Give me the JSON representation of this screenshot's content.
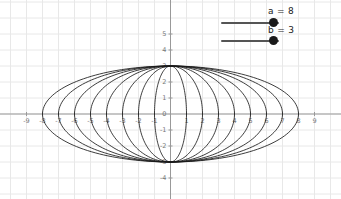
{
  "app": {
    "title": "Graphing Calculator"
  },
  "sliders": [
    {
      "name": "a",
      "label": "a = 8",
      "value": 8,
      "min": 1,
      "max": 9
    },
    {
      "name": "b",
      "label": "b = 3",
      "value": 3,
      "min": 1,
      "max": 5
    }
  ],
  "chart_data": {
    "type": "line",
    "title": "",
    "xlabel": "",
    "ylabel": "",
    "xlim": [
      -9.8,
      9.8
    ],
    "ylim": [
      -4.8,
      9.6
    ],
    "grid": true,
    "legend": false,
    "axis_color": "#999999",
    "grid_color": "#e8e8e8",
    "curve_color": "#1a1a1a",
    "x_ticks": [
      -9,
      -8,
      -7,
      -6,
      -5,
      -4,
      -3,
      -2,
      -1,
      0,
      1,
      2,
      3,
      4,
      5,
      6,
      7,
      8,
      9
    ],
    "x_tick_labels": [
      "-9",
      "-8",
      "-7",
      "-6",
      "-5",
      "-4",
      "-3",
      "-2",
      "-1",
      "",
      "1",
      "2",
      "3",
      "4",
      "5",
      "6",
      "7",
      "8",
      "9"
    ],
    "y_ticks": [
      -4,
      -3,
      -2,
      -1,
      0,
      1,
      2,
      3,
      4,
      5,
      9
    ],
    "y_tick_labels": [
      "-4",
      "-3",
      "-2",
      "-1",
      "0",
      "1",
      "2",
      "3",
      "4",
      "5",
      "9"
    ],
    "series": [
      {
        "name": "ellipse-k1",
        "semi_x": 1,
        "semi_y": 3
      },
      {
        "name": "ellipse-k2",
        "semi_x": 2,
        "semi_y": 3
      },
      {
        "name": "ellipse-k3",
        "semi_x": 3,
        "semi_y": 3
      },
      {
        "name": "ellipse-k4",
        "semi_x": 4,
        "semi_y": 3
      },
      {
        "name": "ellipse-k5",
        "semi_x": 5,
        "semi_y": 3
      },
      {
        "name": "ellipse-k6",
        "semi_x": 6,
        "semi_y": 3
      },
      {
        "name": "ellipse-k7",
        "semi_x": 7,
        "semi_y": 3
      },
      {
        "name": "ellipse-k8",
        "semi_x": 8,
        "semi_y": 3
      }
    ]
  }
}
